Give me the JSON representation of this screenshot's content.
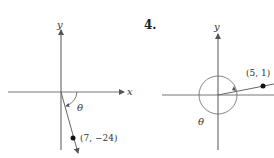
{
  "figures": [
    {
      "id": "left",
      "problem_number": "",
      "axis_labels": {
        "x": "x",
        "y": "y"
      },
      "angle_label": "θ",
      "point": {
        "x": 7,
        "y": -24,
        "label": "(7, −24)"
      },
      "description": "Angle θ in standard position with terminal side through (7, −24) in quadrant IV"
    },
    {
      "id": "right",
      "problem_number": "4.",
      "axis_labels": {
        "y": "y"
      },
      "angle_label": "θ",
      "point": {
        "x": 5,
        "y": 1,
        "label": "(5, 1)"
      },
      "description": "Angle θ greater than 360° (circular arrow) with terminal side through (5, 1) in quadrant I"
    }
  ],
  "colors": {
    "axis": "#555555",
    "ray": "#666666",
    "point": "#111111",
    "background": "#ffffff"
  }
}
